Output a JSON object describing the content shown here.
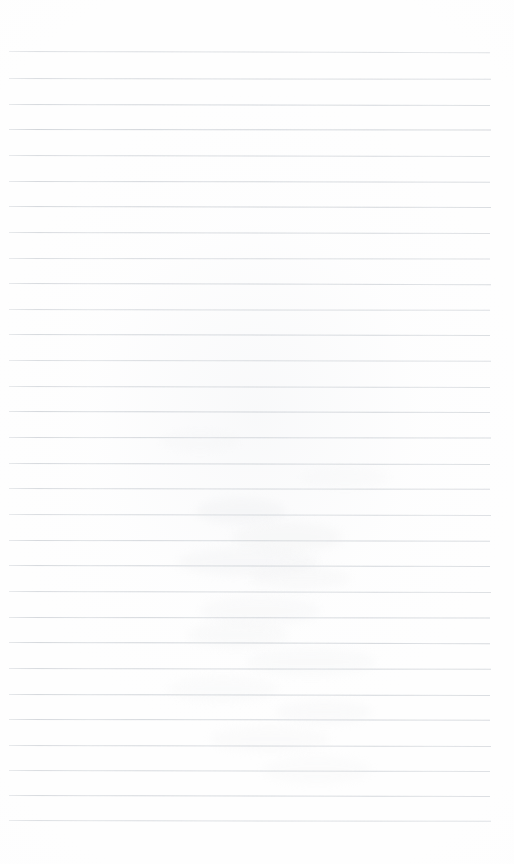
{
  "document": {
    "kind": "scanned-ruled-notebook-paper",
    "title": "Blank ruled notebook page",
    "content_text": "",
    "page_width_px": 514,
    "page_height_px": 864,
    "background_color": "#fefefe",
    "has_visible_text": false,
    "has_margin_rule": false,
    "has_header": false,
    "has_footer": false
  },
  "ruling": {
    "line_count": 31,
    "line_color": "#ced2d7",
    "line_thickness_px": 1,
    "first_line_y_px": 51,
    "last_line_y_px": 820,
    "line_spacing_px": 25.65,
    "line_start_x_px": 9,
    "line_end_x_px": 491,
    "top_margin_px": 51,
    "bottom_margin_px": 44,
    "left_margin_px": 9,
    "right_margin_px": 23,
    "lines": [
      {
        "index": 1,
        "y": 51,
        "x1": 9,
        "x2": 490,
        "slant_px": 1.2,
        "opacity": 0.72
      },
      {
        "index": 2,
        "y": 78,
        "x1": 9,
        "x2": 491,
        "slant_px": 0.8,
        "opacity": 0.8
      },
      {
        "index": 3,
        "y": 104,
        "x1": 9,
        "x2": 490,
        "slant_px": 1.0,
        "opacity": 0.88
      },
      {
        "index": 4,
        "y": 129,
        "x1": 9,
        "x2": 491,
        "slant_px": 0.6,
        "opacity": 0.95
      },
      {
        "index": 5,
        "y": 155,
        "x1": 9,
        "x2": 490,
        "slant_px": 1.1,
        "opacity": 0.82
      },
      {
        "index": 6,
        "y": 181,
        "x1": 9,
        "x2": 490,
        "slant_px": 0.7,
        "opacity": 0.86
      },
      {
        "index": 7,
        "y": 206,
        "x1": 9,
        "x2": 491,
        "slant_px": 0.9,
        "opacity": 0.9
      },
      {
        "index": 8,
        "y": 232,
        "x1": 9,
        "x2": 490,
        "slant_px": 1.0,
        "opacity": 0.84
      },
      {
        "index": 9,
        "y": 258,
        "x1": 9,
        "x2": 490,
        "slant_px": 0.6,
        "opacity": 0.78
      },
      {
        "index": 10,
        "y": 283,
        "x1": 9,
        "x2": 491,
        "slant_px": 1.2,
        "opacity": 0.86
      },
      {
        "index": 11,
        "y": 309,
        "x1": 9,
        "x2": 490,
        "slant_px": 0.8,
        "opacity": 0.8
      },
      {
        "index": 12,
        "y": 334,
        "x1": 9,
        "x2": 490,
        "slant_px": 1.0,
        "opacity": 0.88
      },
      {
        "index": 13,
        "y": 360,
        "x1": 9,
        "x2": 491,
        "slant_px": 0.7,
        "opacity": 0.76
      },
      {
        "index": 14,
        "y": 386,
        "x1": 9,
        "x2": 490,
        "slant_px": 1.1,
        "opacity": 0.82
      },
      {
        "index": 15,
        "y": 411,
        "x1": 9,
        "x2": 490,
        "slant_px": 0.9,
        "opacity": 0.92
      },
      {
        "index": 16,
        "y": 437,
        "x1": 9,
        "x2": 491,
        "slant_px": 0.6,
        "opacity": 0.86
      },
      {
        "index": 17,
        "y": 463,
        "x1": 9,
        "x2": 490,
        "slant_px": 1.0,
        "opacity": 0.88
      },
      {
        "index": 18,
        "y": 488,
        "x1": 9,
        "x2": 490,
        "slant_px": 0.8,
        "opacity": 0.84
      },
      {
        "index": 19,
        "y": 514,
        "x1": 9,
        "x2": 491,
        "slant_px": 1.1,
        "opacity": 0.8
      },
      {
        "index": 20,
        "y": 540,
        "x1": 9,
        "x2": 490,
        "slant_px": 0.7,
        "opacity": 0.86
      },
      {
        "index": 21,
        "y": 565,
        "x1": 9,
        "x2": 490,
        "slant_px": 0.9,
        "opacity": 0.9
      },
      {
        "index": 22,
        "y": 591,
        "x1": 9,
        "x2": 491,
        "slant_px": 1.0,
        "opacity": 0.82
      },
      {
        "index": 23,
        "y": 617,
        "x1": 9,
        "x2": 490,
        "slant_px": 0.6,
        "opacity": 0.88
      },
      {
        "index": 24,
        "y": 642,
        "x1": 9,
        "x2": 490,
        "slant_px": 1.2,
        "opacity": 0.92
      },
      {
        "index": 25,
        "y": 668,
        "x1": 9,
        "x2": 491,
        "slant_px": 0.8,
        "opacity": 0.86
      },
      {
        "index": 26,
        "y": 694,
        "x1": 9,
        "x2": 490,
        "slant_px": 1.0,
        "opacity": 0.9
      },
      {
        "index": 27,
        "y": 719,
        "x1": 9,
        "x2": 490,
        "slant_px": 0.7,
        "opacity": 0.88
      },
      {
        "index": 28,
        "y": 745,
        "x1": 9,
        "x2": 491,
        "slant_px": 1.1,
        "opacity": 0.84
      },
      {
        "index": 29,
        "y": 770,
        "x1": 9,
        "x2": 490,
        "slant_px": 0.9,
        "opacity": 0.8
      },
      {
        "index": 30,
        "y": 795,
        "x1": 9,
        "x2": 490,
        "slant_px": 1.0,
        "opacity": 0.86
      },
      {
        "index": 31,
        "y": 820,
        "x1": 9,
        "x2": 491,
        "slant_px": 0.8,
        "opacity": 0.74
      }
    ]
  },
  "artifacts": {
    "description": "faint scan smudges / erased pencil residue in central region",
    "smudges": [
      {
        "x": 196,
        "y": 498,
        "w": 90,
        "h": 26,
        "opacity": 0.28,
        "color": "#e9eaec"
      },
      {
        "x": 232,
        "y": 522,
        "w": 110,
        "h": 30,
        "opacity": 0.26,
        "color": "#eceded"
      },
      {
        "x": 178,
        "y": 548,
        "w": 140,
        "h": 28,
        "opacity": 0.24,
        "color": "#eaebed"
      },
      {
        "x": 250,
        "y": 566,
        "w": 100,
        "h": 24,
        "opacity": 0.22,
        "color": "#ededee"
      },
      {
        "x": 200,
        "y": 596,
        "w": 120,
        "h": 30,
        "opacity": 0.2,
        "color": "#ebecee"
      },
      {
        "x": 188,
        "y": 622,
        "w": 100,
        "h": 26,
        "opacity": 0.22,
        "color": "#eceded"
      },
      {
        "x": 246,
        "y": 648,
        "w": 130,
        "h": 28,
        "opacity": 0.2,
        "color": "#eceeef"
      },
      {
        "x": 168,
        "y": 676,
        "w": 110,
        "h": 26,
        "opacity": 0.18,
        "color": "#edeeef"
      },
      {
        "x": 276,
        "y": 700,
        "w": 96,
        "h": 24,
        "opacity": 0.2,
        "color": "#ebecee"
      },
      {
        "x": 210,
        "y": 726,
        "w": 120,
        "h": 26,
        "opacity": 0.18,
        "color": "#ededee"
      },
      {
        "x": 262,
        "y": 756,
        "w": 110,
        "h": 28,
        "opacity": 0.16,
        "color": "#eeeff0"
      },
      {
        "x": 160,
        "y": 430,
        "w": 80,
        "h": 22,
        "opacity": 0.16,
        "color": "#eeeff0"
      },
      {
        "x": 300,
        "y": 466,
        "w": 90,
        "h": 22,
        "opacity": 0.16,
        "color": "#eeeff0"
      }
    ]
  }
}
